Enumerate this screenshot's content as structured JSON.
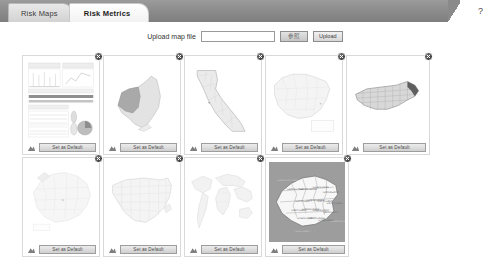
{
  "header": {
    "tabs": [
      {
        "label": "Risk Maps",
        "active": false
      },
      {
        "label": "Risk Metrics",
        "active": true
      }
    ],
    "help_icon": "question-mark-icon"
  },
  "upload": {
    "label": "Upload map file",
    "input_value": "",
    "input_placeholder": "",
    "browse_label": "参照",
    "upload_label": "Upload"
  },
  "cards": {
    "close_icon": "close-icon",
    "default_icon": "set-default-icon",
    "set_default_label": "Set as Default",
    "items": [
      {
        "name": "dashboard-report",
        "kind": "dashboard",
        "bg": "white"
      },
      {
        "name": "new-york-state-map",
        "kind": "new-york",
        "bg": "white"
      },
      {
        "name": "california-counties-map",
        "kind": "california",
        "bg": "white"
      },
      {
        "name": "spain-provinces-map",
        "kind": "spain",
        "bg": "white"
      },
      {
        "name": "north-carolina-counties-map",
        "kind": "north-carolina",
        "bg": "white"
      },
      {
        "name": "europe-map",
        "kind": "europe",
        "bg": "white"
      },
      {
        "name": "usa-counties-map",
        "kind": "usa",
        "bg": "white"
      },
      {
        "name": "world-map",
        "kind": "world",
        "bg": "white"
      },
      {
        "name": "china-provinces-map",
        "kind": "china",
        "bg": "gray"
      }
    ]
  },
  "colors": {
    "header_bar": "#8a8a8a",
    "active_tab": "#ffffff",
    "inactive_tab": "#d8d8d8",
    "card_border": "#d9d9d9",
    "button_face": "#dcdcdc",
    "map_fill": "#e8e8e8",
    "map_stroke": "#b6b6b6",
    "china_bg": "#9d9d9d"
  }
}
